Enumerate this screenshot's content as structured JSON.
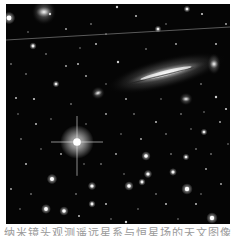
{
  "image": {
    "subject": "deep-field astronomical image with an edge-on spiral galaxy and a bright diffraction-spike star",
    "background": "#050505",
    "frame": {
      "x": 6,
      "y": 4,
      "width": 224,
      "height": 220
    },
    "satellite_trail": {
      "x1": 0,
      "y1": 36,
      "x2": 224,
      "y2": 23,
      "color": "#8a8a8a"
    },
    "galaxies": [
      {
        "name": "edge-on-spiral-galaxy",
        "cx": 160,
        "cy": 69,
        "rx": 44,
        "ry": 7,
        "angle": -14
      },
      {
        "name": "fuzzy-galaxy-top-left",
        "cx": 38,
        "cy": 8,
        "rx": 9,
        "ry": 6,
        "angle": 0
      },
      {
        "name": "small-galaxy-right",
        "cx": 208,
        "cy": 60,
        "rx": 5,
        "ry": 5,
        "angle": 0
      },
      {
        "name": "faint-galaxy-center",
        "cx": 92,
        "cy": 89,
        "rx": 5,
        "ry": 3,
        "angle": -20
      },
      {
        "name": "faint-galaxy-below",
        "cx": 180,
        "cy": 95,
        "rx": 5,
        "ry": 3,
        "angle": 0
      }
    ],
    "bright_star": {
      "cx": 71,
      "cy": 138,
      "r": 7,
      "spike": 26
    },
    "stars": [
      [
        3,
        14,
        2.4
      ],
      [
        44,
        10,
        1.2
      ],
      [
        111,
        3,
        1.2
      ],
      [
        181,
        5,
        1.3
      ],
      [
        196,
        10,
        1.1
      ],
      [
        130,
        12,
        1.0
      ],
      [
        152,
        25,
        1.3
      ],
      [
        27,
        42,
        1.4
      ],
      [
        112,
        58,
        1.2
      ],
      [
        72,
        60,
        1.0
      ],
      [
        50,
        80,
        1.3
      ],
      [
        60,
        62,
        0.9
      ],
      [
        80,
        72,
        0.9
      ],
      [
        10,
        94,
        1.0
      ],
      [
        28,
        95,
        1.1
      ],
      [
        20,
        70,
        0.8
      ],
      [
        210,
        93,
        1.2
      ],
      [
        220,
        105,
        1.1
      ],
      [
        198,
        128,
        1.3
      ],
      [
        214,
        118,
        0.9
      ],
      [
        150,
        118,
        1.0
      ],
      [
        46,
        175,
        2.0
      ],
      [
        40,
        205,
        1.9
      ],
      [
        58,
        207,
        1.8
      ],
      [
        86,
        182,
        1.6
      ],
      [
        86,
        200,
        1.4
      ],
      [
        140,
        152,
        1.8
      ],
      [
        142,
        170,
        1.6
      ],
      [
        136,
        178,
        1.4
      ],
      [
        123,
        182,
        1.8
      ],
      [
        167,
        168,
        1.5
      ],
      [
        180,
        153,
        1.3
      ],
      [
        181,
        185,
        2.2
      ],
      [
        206,
        214,
        2.2
      ],
      [
        120,
        218,
        1.2
      ],
      [
        100,
        200,
        1.0
      ],
      [
        73,
        212,
        1.0
      ],
      [
        20,
        160,
        1.0
      ],
      [
        5,
        185,
        0.9
      ],
      [
        160,
        200,
        1.0
      ],
      [
        190,
        200,
        1.0
      ],
      [
        200,
        165,
        0.9
      ],
      [
        30,
        120,
        1.0
      ],
      [
        15,
        135,
        0.8
      ],
      [
        100,
        110,
        0.9
      ],
      [
        120,
        95,
        0.9
      ],
      [
        60,
        25,
        0.9
      ],
      [
        90,
        40,
        1.0
      ],
      [
        170,
        40,
        0.9
      ],
      [
        210,
        40,
        1.0
      ],
      [
        220,
        20,
        0.9
      ],
      [
        135,
        135,
        0.9
      ],
      [
        110,
        150,
        0.9
      ],
      [
        55,
        150,
        0.9
      ],
      [
        95,
        160,
        0.8
      ],
      [
        160,
        130,
        0.8
      ],
      [
        175,
        110,
        0.8
      ],
      [
        190,
        145,
        0.8
      ],
      [
        25,
        190,
        0.8
      ],
      [
        70,
        190,
        0.8
      ],
      [
        150,
        190,
        0.8
      ],
      [
        215,
        180,
        0.9
      ],
      [
        5,
        60,
        0.8
      ],
      [
        40,
        50,
        0.8
      ],
      [
        85,
        20,
        0.8
      ],
      [
        140,
        45,
        0.8
      ],
      [
        195,
        80,
        0.8
      ],
      [
        65,
        100,
        0.8
      ],
      [
        128,
        110,
        0.8
      ],
      [
        165,
        150,
        0.8
      ],
      [
        205,
        150,
        0.8
      ],
      [
        35,
        145,
        0.7
      ],
      [
        115,
        130,
        0.7
      ],
      [
        155,
        95,
        0.7
      ],
      [
        100,
        80,
        0.7
      ],
      [
        12,
        110,
        0.7
      ],
      [
        45,
        115,
        0.7
      ],
      [
        80,
        120,
        0.7
      ],
      [
        185,
        125,
        0.7
      ],
      [
        222,
        140,
        0.7
      ],
      [
        14,
        205,
        0.7
      ],
      [
        105,
        215,
        0.7
      ],
      [
        132,
        205,
        0.7
      ],
      [
        172,
        215,
        0.7
      ],
      [
        195,
        190,
        0.7
      ],
      [
        78,
        160,
        0.7
      ],
      [
        118,
        170,
        0.7
      ],
      [
        198,
        108,
        0.7
      ],
      [
        160,
        20,
        0.7
      ],
      [
        100,
        30,
        0.7
      ],
      [
        22,
        28,
        0.7
      ],
      [
        74,
        44,
        0.7
      ]
    ]
  },
  "caption": {
    "text": "纳米镜头观测遥远星系与恒星场的天文图像"
  }
}
